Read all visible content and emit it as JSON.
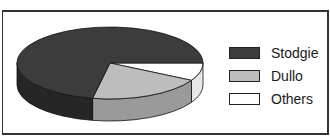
{
  "chart_data": {
    "type": "pie",
    "style": "3d",
    "title": "",
    "categories": [
      "Stodgie",
      "Dullo",
      "Others"
    ],
    "values": [
      72,
      20,
      8
    ],
    "unit": "%",
    "colors": [
      "#3c3c3c",
      "#bdbdbd",
      "#ffffff"
    ],
    "legend_position": "right"
  },
  "legend": {
    "items": [
      {
        "label": "Stodgie",
        "color": "#3c3c3c"
      },
      {
        "label": "Dullo",
        "color": "#bdbdbd"
      },
      {
        "label": "Others",
        "color": "#ffffff"
      }
    ]
  }
}
